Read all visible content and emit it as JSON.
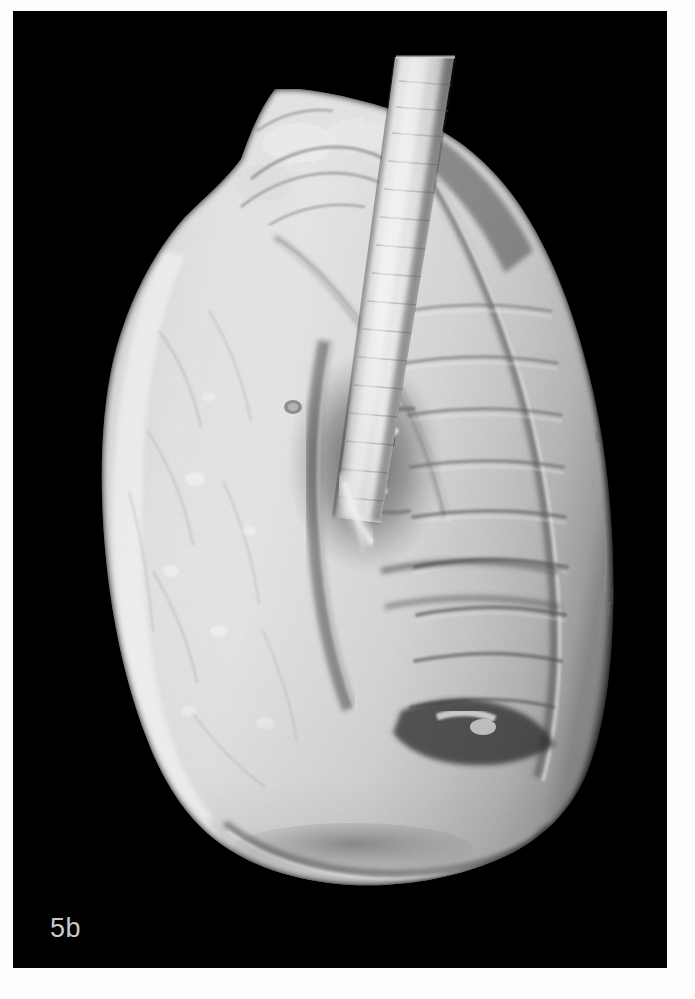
{
  "figure": {
    "label": "5b",
    "modality": "3D volume-rendered CT",
    "view": "lateral",
    "background_color": "#000000",
    "page_color": "#fdfdfd",
    "label_color": "#c9c9c9",
    "tissue_highlight_color": "#f2f2f2",
    "tissue_midtone_color": "#b9b9b9",
    "tissue_shadow_color": "#4e4e4e"
  },
  "panel": {
    "x": 13,
    "y": 11,
    "width": 654,
    "height": 957
  },
  "structures": [
    {
      "name": "trachea",
      "description": "bright tubular airway descending obliquely from the superior edge of the volume"
    },
    {
      "name": "main-bronchus",
      "description": "continuation of the airway toward the hilum"
    },
    {
      "name": "lung-apex",
      "description": "irregular lobulated superior surface"
    },
    {
      "name": "anterior-border",
      "description": "smooth convex anterior margin on the left of the image"
    },
    {
      "name": "posterior-border",
      "description": "shaded stair-stepped posterior margin on the right of the image"
    },
    {
      "name": "oblique-fissure",
      "description": "long curved groove dividing the upper and lower lobes"
    },
    {
      "name": "hilum",
      "description": "central recess with bright circular vessel cross-sections"
    },
    {
      "name": "pulmonary-vessel-stump",
      "description": "bright ring-shaped cut vessel at the hilum"
    },
    {
      "name": "rib-impressions",
      "description": "series of horizontal grooves on the costal surface"
    },
    {
      "name": "diaphragmatic-surface",
      "description": "concave inferior base of the lung"
    },
    {
      "name": "costophrenic-edge",
      "description": "sharp inferior rim where the base meets the costal surface"
    }
  ]
}
